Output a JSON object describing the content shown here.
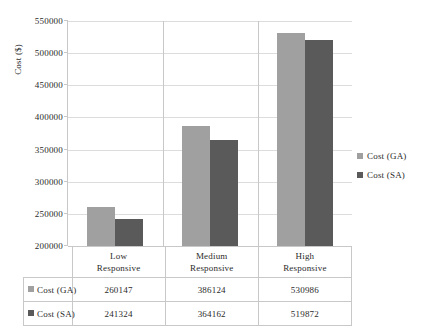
{
  "chart_data": {
    "type": "bar",
    "title": "",
    "subtitle": "",
    "xlabel": "",
    "ylabel": "Cost ($)",
    "categories": [
      "Low Responsive",
      "Medium Responsive",
      "High Responsive"
    ],
    "category_lines": [
      [
        "Low",
        "Responsive"
      ],
      [
        "Medium",
        "Responsive"
      ],
      [
        "High",
        "Responsive"
      ]
    ],
    "series": [
      {
        "name": "Cost (GA)",
        "values": [
          260147,
          386124,
          530986
        ],
        "color": "#a0a0a0"
      },
      {
        "name": "Cost (SA)",
        "values": [
          241324,
          364162,
          519872
        ],
        "color": "#5a5a5a"
      }
    ],
    "ylim": [
      200000,
      550000
    ],
    "ytick_step": 50000,
    "yticks": [
      550000,
      500000,
      450000,
      400000,
      350000,
      300000,
      250000,
      200000
    ],
    "ytick_labels": [
      "550000",
      "500000",
      "450000",
      "400000",
      "350000",
      "300000",
      "250000",
      "200000"
    ],
    "grid": true,
    "grid_axis": "y",
    "legend_position": "right",
    "data_table": true
  },
  "axis": {
    "y_title": "Cost ($)"
  },
  "legend": {
    "items": [
      {
        "label": "Cost (GA)",
        "color": "#a0a0a0"
      },
      {
        "label": "Cost (SA)",
        "color": "#5a5a5a"
      }
    ]
  },
  "table": {
    "rows": [
      {
        "label": "Cost (GA)",
        "color": "#a0a0a0",
        "cells": [
          "260147",
          "386124",
          "530986"
        ]
      },
      {
        "label": "Cost (SA)",
        "color": "#5a5a5a",
        "cells": [
          "241324",
          "364162",
          "519872"
        ]
      }
    ]
  },
  "colors": {
    "series_ga": "#a0a0a0",
    "series_sa": "#5a5a5a",
    "grid": "#dcdcdc",
    "axis": "#c8c8c8",
    "text": "#2b2b2b",
    "background": "#ffffff"
  }
}
